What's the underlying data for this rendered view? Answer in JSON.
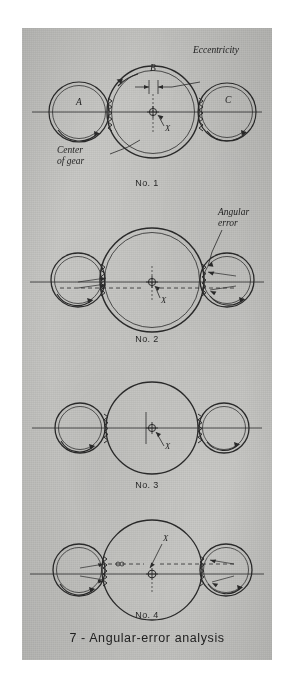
{
  "figure": {
    "caption": "7 - Angular-error analysis",
    "panel_color": "#c9c9c6",
    "ink_color": "#1f1f1f"
  },
  "annotations": {
    "eccentricity": "Eccentricity",
    "center_of_gear_line1": "Center",
    "center_of_gear_line2": "of gear",
    "angular_error_line1": "Angular",
    "angular_error_line2": "error",
    "gear_a": "A",
    "gear_b": "B",
    "gear_c": "C",
    "axis_x": "X"
  },
  "diagrams": [
    {
      "id": "no1",
      "label": "No. 1",
      "gears": [
        "A",
        "B",
        "C"
      ],
      "has_eccentricity_callout": true,
      "has_center_of_gear_callout": true,
      "has_angular_error_callout": false,
      "center_gear_double_outline": true,
      "center_marker": "crosshair-circle",
      "x_label": "X"
    },
    {
      "id": "no2",
      "label": "No. 2",
      "gears": [
        "",
        "",
        ""
      ],
      "has_eccentricity_callout": false,
      "has_center_of_gear_callout": false,
      "has_angular_error_callout": true,
      "center_gear_double_outline": true,
      "center_marker": "crosshair-circle",
      "x_label": "X"
    },
    {
      "id": "no3",
      "label": "No. 3",
      "gears": [
        "",
        "",
        ""
      ],
      "has_eccentricity_callout": false,
      "has_center_of_gear_callout": false,
      "has_angular_error_callout": false,
      "center_gear_double_outline": false,
      "center_marker": "crosshair-circle",
      "x_label": "X"
    },
    {
      "id": "no4",
      "label": "No. 4",
      "gears": [
        "",
        "",
        ""
      ],
      "has_eccentricity_callout": false,
      "has_center_of_gear_callout": false,
      "has_angular_error_callout": false,
      "center_gear_double_outline": false,
      "center_marker": "crosshair-circle",
      "x_label": "X"
    }
  ]
}
